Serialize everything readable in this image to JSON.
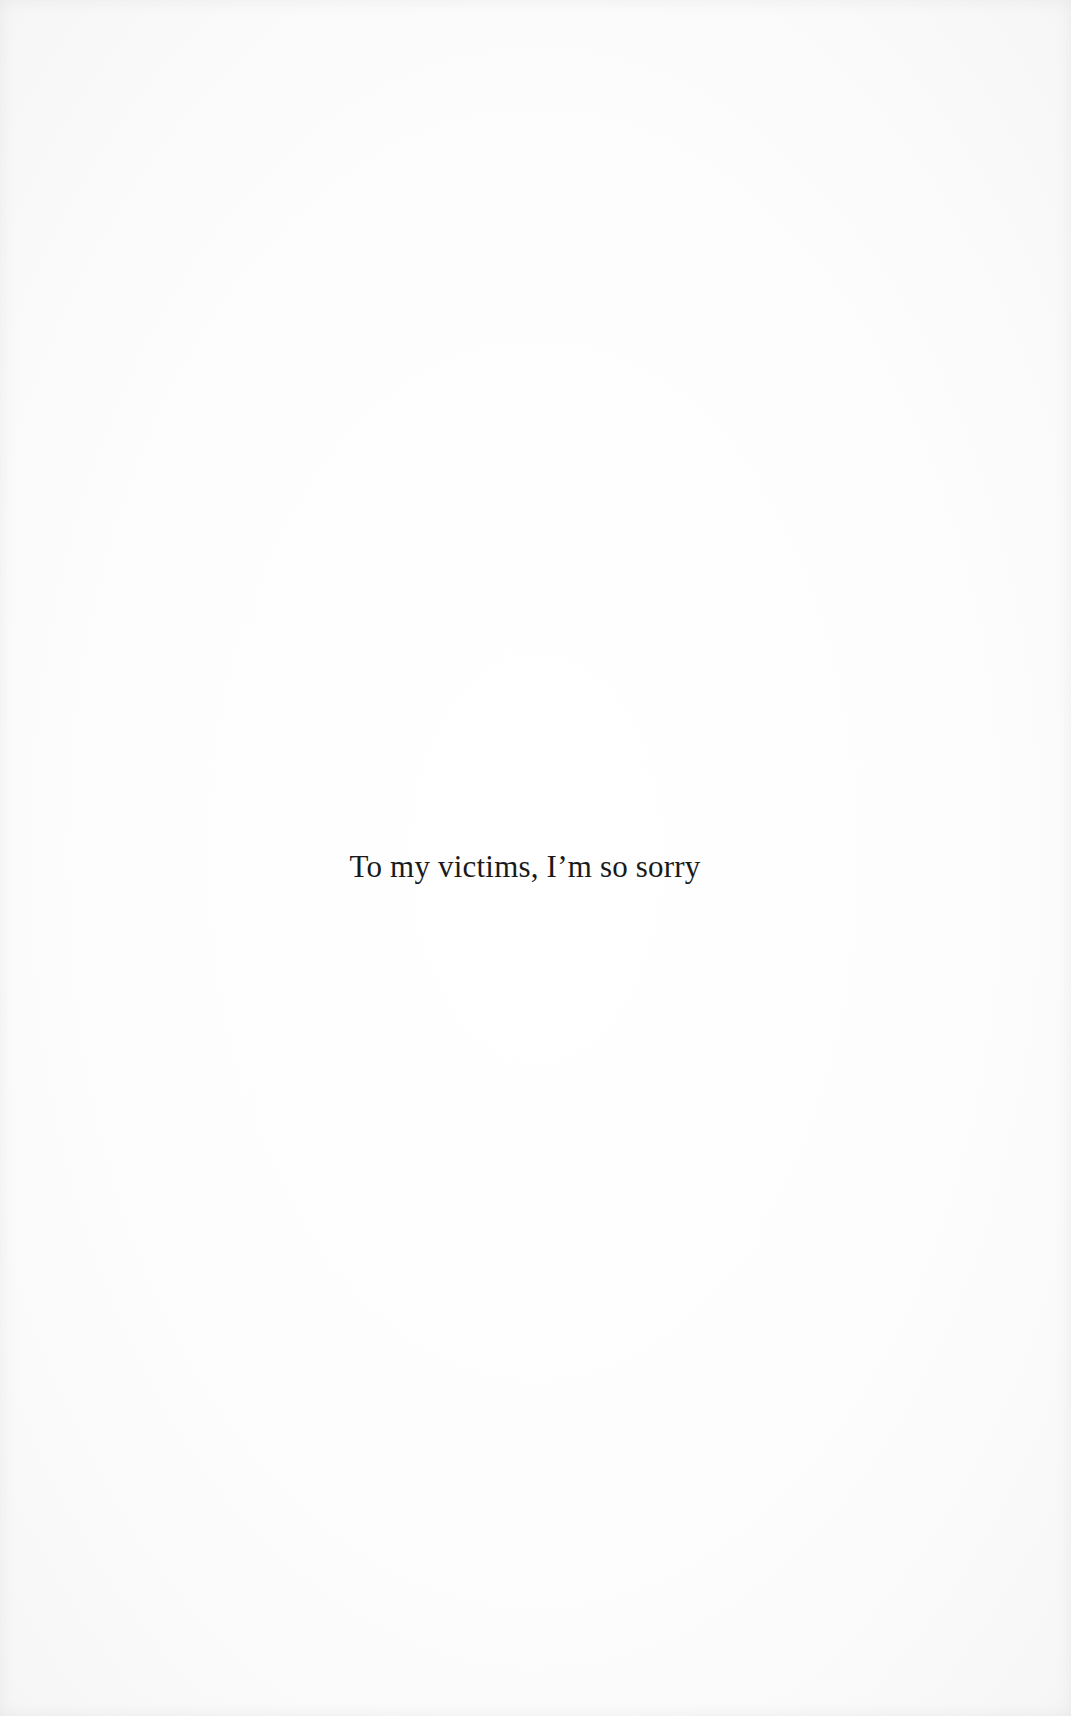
{
  "page": {
    "type": "dedication",
    "background_color": "#fdfdfd",
    "text_color": "#1a1a1a"
  },
  "dedication": {
    "text": "To my victims, I’m so sorry"
  }
}
